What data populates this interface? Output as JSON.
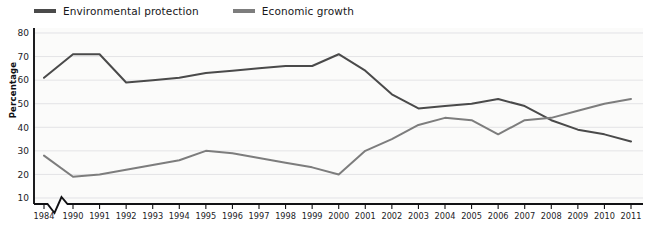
{
  "legend": {
    "position": "top-left",
    "items": [
      {
        "label": "Environmental protection",
        "color": "#4a4a4a",
        "icon": "line-swatch-icon"
      },
      {
        "label": "Economic growth",
        "color": "#7d7d7d",
        "icon": "line-swatch-icon"
      }
    ]
  },
  "axes": {
    "y_title": "Percentage",
    "y_ticks": [
      "10",
      "20",
      "30",
      "40",
      "50",
      "60",
      "70",
      "80"
    ],
    "x_ticks": [
      "1984",
      "1990",
      "1991",
      "1992",
      "1993",
      "1994",
      "1995",
      "1996",
      "1997",
      "1998",
      "1999",
      "2000",
      "2001",
      "2002",
      "2003",
      "2004",
      "2005",
      "2006",
      "2007",
      "2008",
      "2009",
      "2010",
      "2011"
    ],
    "axis_break": "1984-1990"
  },
  "chart_data": {
    "type": "line",
    "title": "",
    "subtitle": "",
    "xlabel": "",
    "ylabel": "Percentage",
    "ylim": [
      5,
      80
    ],
    "yticks": [
      10,
      20,
      30,
      40,
      50,
      60,
      70,
      80
    ],
    "grid": true,
    "legend_position": "top-left",
    "axis_break_after_first_category": true,
    "categories": [
      "1984",
      "1990",
      "1991",
      "1992",
      "1993",
      "1994",
      "1995",
      "1996",
      "1997",
      "1998",
      "1999",
      "2000",
      "2001",
      "2002",
      "2003",
      "2004",
      "2005",
      "2006",
      "2007",
      "2008",
      "2009",
      "2010",
      "2011"
    ],
    "series": [
      {
        "name": "Environmental protection",
        "color": "#4a4a4a",
        "values": [
          61,
          71,
          71,
          59,
          60,
          61,
          63,
          64,
          65,
          66,
          66,
          71,
          64,
          54,
          48,
          49,
          50,
          52,
          49,
          43,
          39,
          37,
          34
        ]
      },
      {
        "name": "Economic growth",
        "color": "#7d7d7d",
        "values": [
          28,
          19,
          20,
          22,
          24,
          26,
          30,
          29,
          27,
          25,
          23,
          20,
          30,
          35,
          41,
          44,
          43,
          37,
          43,
          44,
          47,
          50,
          52
        ]
      }
    ]
  }
}
